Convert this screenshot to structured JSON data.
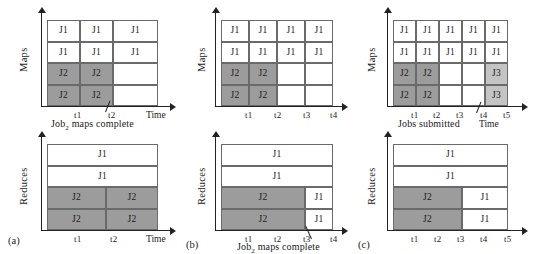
{
  "figure": {
    "title": "Map and Reduce slot occupancy timelines for three scheduling scenarios",
    "job_labels": {
      "j1": "J1",
      "j2": "J2",
      "j3": "J3"
    },
    "axis_names": {
      "time": "Time",
      "maps": "Maps",
      "reduces": "Reduces"
    },
    "colors": {
      "j1": "#ffffff",
      "j2": "#9c9c9c",
      "j3": "#c4c4c4",
      "line": "#6a6a6a",
      "axis": "#222222"
    }
  },
  "panels": [
    {
      "id": "a",
      "caption": "(a)",
      "maps": {
        "axis_y_label": "Maps",
        "axis_x_label": "Time",
        "ticks": [
          "t1",
          "t2"
        ],
        "annotation": "Job₂ maps complete",
        "annotation_target": "t2",
        "columns": 3,
        "rows": [
          [
            "J1",
            "J1",
            "J1"
          ],
          [
            "J1",
            "J1",
            "J1"
          ],
          [
            "J2",
            "J2",
            ""
          ],
          [
            "J2",
            "J2",
            ""
          ]
        ]
      },
      "reduces": {
        "axis_y_label": "Reduces",
        "axis_x_label": "Time",
        "ticks": [
          "t1",
          "t2"
        ],
        "rows": [
          [
            "J1"
          ],
          [
            "J1"
          ],
          [
            "J2",
            "J2"
          ],
          [
            "J2",
            "J2"
          ]
        ]
      }
    },
    {
      "id": "b",
      "caption": "(b)",
      "maps": {
        "axis_y_label": "Maps",
        "axis_x_label": "",
        "ticks": [
          "t1",
          "t2",
          "t3",
          "t4"
        ],
        "columns": 4,
        "rows": [
          [
            "J1",
            "J1",
            "J1",
            "J1"
          ],
          [
            "J1",
            "J1",
            "J1",
            "J1"
          ],
          [
            "J2",
            "J2",
            "",
            ""
          ],
          [
            "J2",
            "J2",
            "",
            ""
          ]
        ]
      },
      "reduces": {
        "axis_y_label": "Reduces",
        "axis_x_label": "",
        "ticks": [
          "t1",
          "t2",
          "t3",
          "t4"
        ],
        "annotation": "Job₂ maps complete",
        "annotation_target": "t3",
        "rows": [
          [
            "J1"
          ],
          [
            "J1"
          ],
          [
            "J2",
            "J1"
          ],
          [
            "J2",
            "J1"
          ]
        ]
      }
    },
    {
      "id": "c",
      "caption": "(c)",
      "maps": {
        "axis_y_label": "Maps",
        "axis_x_label": "Time",
        "ticks": [
          "t1",
          "t2",
          "t3",
          "t4",
          "t5"
        ],
        "annotation": "Jobs submitted",
        "annotation_target": "t4",
        "columns": 5,
        "rows": [
          [
            "J1",
            "J1",
            "J1",
            "J1",
            "J1"
          ],
          [
            "J1",
            "J1",
            "J1",
            "J1",
            "J1"
          ],
          [
            "J2",
            "J2",
            "",
            "",
            "J3"
          ],
          [
            "J2",
            "J2",
            "",
            "",
            "J3"
          ]
        ]
      },
      "reduces": {
        "axis_y_label": "Reduces",
        "axis_x_label": "",
        "ticks": [
          "t1",
          "t2",
          "t3",
          "t4",
          "t5"
        ],
        "rows": [
          [
            "J1"
          ],
          [
            "J1"
          ],
          [
            "J2",
            "J1"
          ],
          [
            "J2",
            "J1"
          ]
        ]
      }
    }
  ]
}
